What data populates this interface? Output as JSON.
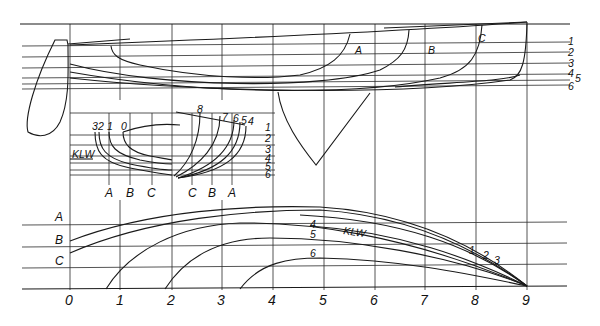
{
  "drawing": {
    "title": "Ship lines plan",
    "views": [
      "profile (sheer plan)",
      "body plan",
      "half-breadth plan"
    ]
  },
  "profile": {
    "waterline_labels": [
      "1",
      "2",
      "3",
      "4",
      "5",
      "6"
    ],
    "buttock_labels": [
      "A",
      "B",
      "C"
    ]
  },
  "body_plan": {
    "aft_section_labels": [
      "3",
      "2",
      "1",
      "0"
    ],
    "fwd_section_labels": [
      "8",
      "7",
      "6",
      "5",
      "4"
    ],
    "waterline_labels": [
      "1",
      "2",
      "3",
      "4",
      "5",
      "6"
    ],
    "design_waterline_label": "KLW",
    "buttock_labels_left": [
      "A",
      "B",
      "C"
    ],
    "buttock_labels_right": [
      "C",
      "B",
      "A"
    ]
  },
  "half_breadth": {
    "buttock_labels": [
      "A",
      "B",
      "C"
    ],
    "waterline_curve_labels": [
      "4",
      "5",
      "6"
    ],
    "design_waterline_label": "KLW",
    "diagonal_labels": [
      "1",
      "2",
      "3"
    ]
  },
  "stations": [
    "0",
    "1",
    "2",
    "3",
    "4",
    "5",
    "6",
    "7",
    "8",
    "9"
  ],
  "colors": {
    "line": "#1a1a1a",
    "background": "#ffffff"
  }
}
